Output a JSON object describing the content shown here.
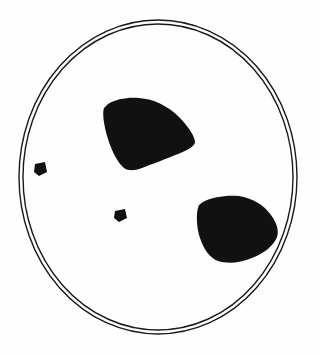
{
  "figure": {
    "background_color": "#fefefe",
    "ink_color": "#111111",
    "outline_color": "#1a1a1a",
    "canvas": {
      "width": 321,
      "height": 355
    },
    "boundary": {
      "name": "double-ring-ellipse",
      "description": "Two concentric thin ellipse outlines forming the dish rim",
      "outer": {
        "cx": 158,
        "cy": 177,
        "rx": 139,
        "ry": 157,
        "stroke_width": 1.4
      },
      "inner": {
        "cx": 158,
        "cy": 177,
        "rx": 135,
        "ry": 153,
        "stroke_width": 1.4
      }
    },
    "regions": [
      {
        "id": "blob-upper",
        "label": "Upper rounded-triangular dark region",
        "fill": "#111111",
        "bbox": {
          "x": 103,
          "y": 97,
          "width": 93,
          "height": 73
        },
        "centroid": {
          "x": 146,
          "y": 133
        }
      },
      {
        "id": "blob-lower-right",
        "label": "Lower-right rounded-triangular dark region",
        "fill": "#111111",
        "bbox": {
          "x": 197,
          "y": 195,
          "width": 82,
          "height": 68
        },
        "centroid": {
          "x": 237,
          "y": 228
        }
      },
      {
        "id": "speck-left",
        "label": "Small square speck near left rim",
        "fill": "#111111",
        "bbox": {
          "x": 34,
          "y": 162,
          "width": 13,
          "height": 13
        },
        "centroid": {
          "x": 40,
          "y": 168
        }
      },
      {
        "id": "speck-center",
        "label": "Small square speck near center",
        "fill": "#111111",
        "bbox": {
          "x": 114,
          "y": 209,
          "width": 13,
          "height": 13
        },
        "centroid": {
          "x": 120,
          "y": 215
        }
      }
    ],
    "counts": {
      "large_regions": 2,
      "small_specks": 2,
      "total_regions": 4
    }
  }
}
